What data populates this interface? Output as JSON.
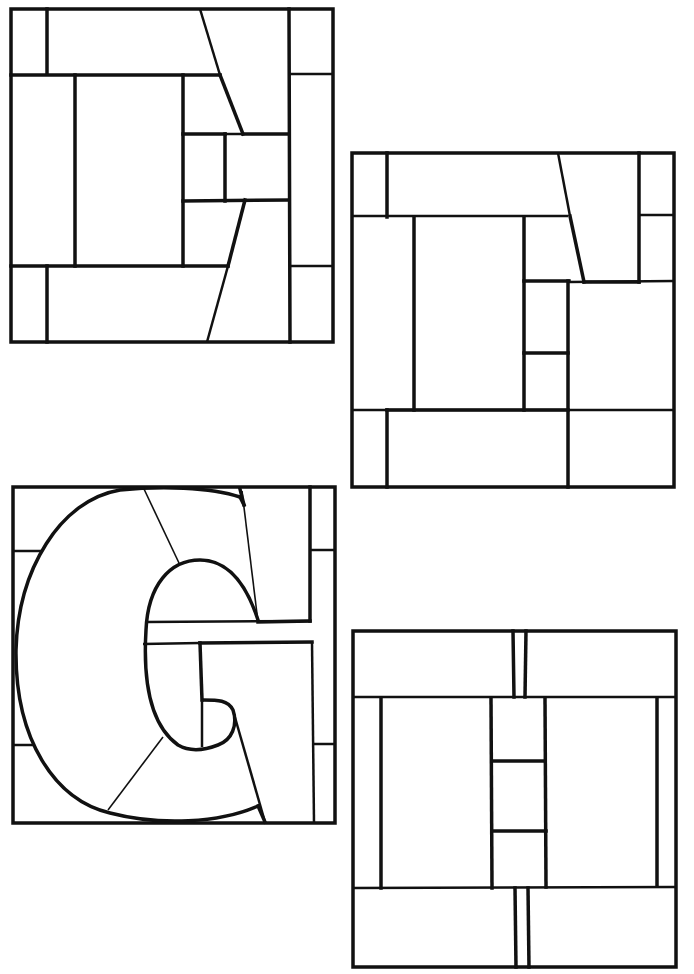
{
  "panels": [
    {
      "id": "panel-1",
      "letter": "D-like block pattern",
      "label": "Pattern 1"
    },
    {
      "id": "panel-2",
      "letter": "E-like block pattern",
      "label": "Pattern 2"
    },
    {
      "id": "panel-3",
      "letter": "G",
      "label": "Pattern 3"
    },
    {
      "id": "panel-4",
      "letter": "H",
      "label": "Pattern 4"
    }
  ],
  "colors": {
    "line": "#111111",
    "background": "#ffffff"
  }
}
